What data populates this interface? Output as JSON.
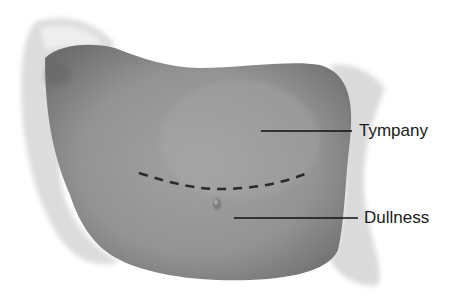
{
  "figure": {
    "labels": [
      {
        "id": "tympany",
        "text": "Tympany"
      },
      {
        "id": "dullness",
        "text": "Dullness"
      }
    ],
    "colors": {
      "skin_base": "#8f8f8f",
      "skin_dark": "#6e6e6e",
      "drape": "#e6e6e6",
      "line": "#111111",
      "text": "#1a1a1a"
    }
  }
}
